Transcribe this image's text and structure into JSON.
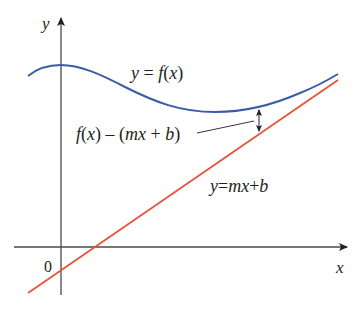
{
  "diagram": {
    "type": "function-vs-line",
    "axes": {
      "x_label": "x",
      "y_label": "y",
      "origin_label": "0",
      "color": "#231f20"
    },
    "curve": {
      "label_lhs": "y",
      "label_eq": " = ",
      "label_f": "f",
      "label_paren_open": "(",
      "label_var": "x",
      "label_paren_close": ")",
      "color": "#3a5ba8"
    },
    "line": {
      "label_y": "y",
      "label_eq": "=",
      "label_m": "m",
      "label_x": "x",
      "label_plus": "+",
      "label_b": "b",
      "color": "#e8533a"
    },
    "difference": {
      "label_f": "f",
      "label_x_open": "(",
      "label_x": "x",
      "label_x_close": ")",
      "label_minus": " – (",
      "label_m": "m",
      "label_x2": "x",
      "label_plus": " + ",
      "label_b": "b",
      "label_close": ")",
      "leader_color": "#231f20",
      "arrow_color": "#231f20"
    }
  }
}
